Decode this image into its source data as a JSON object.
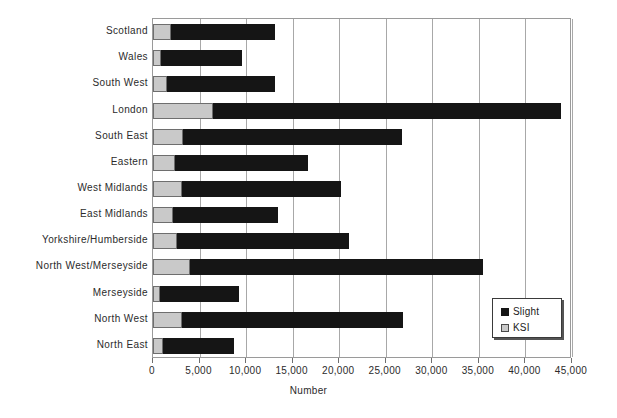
{
  "chart_data": {
    "type": "bar",
    "orientation": "horizontal",
    "stacked": true,
    "title": "",
    "xlabel": "Number",
    "ylabel": "",
    "xlim": [
      0,
      45000
    ],
    "xticks": [
      0,
      5000,
      10000,
      15000,
      20000,
      25000,
      30000,
      35000,
      40000,
      45000
    ],
    "xtick_labels": [
      "0",
      "5,000",
      "10,000",
      "15,000",
      "20,000",
      "25,000",
      "30,000",
      "35,000",
      "40,000",
      "45,000"
    ],
    "grid": "vertical",
    "legend_position": "lower-right",
    "categories": [
      "Scotland",
      "Wales",
      "South West",
      "London",
      "South East",
      "Eastern",
      "West Midlands",
      "East Midlands",
      "Yorkshire/Humberside",
      "North West/Merseyside",
      "Merseyside",
      "North West",
      "North East"
    ],
    "series": [
      {
        "name": "KSI",
        "color": "#c9c9c9",
        "values": [
          1950,
          850,
          1500,
          6450,
          3200,
          2350,
          3100,
          2150,
          2600,
          3950,
          750,
          3100,
          1050
        ]
      },
      {
        "name": "Slight",
        "color": "#151515",
        "values": [
          11150,
          8700,
          11650,
          37350,
          23550,
          14300,
          17100,
          11250,
          18450,
          31500,
          8500,
          23750,
          7650
        ]
      }
    ],
    "totals": [
      13100,
      9550,
      13150,
      43800,
      26750,
      16650,
      20200,
      13400,
      21050,
      35450,
      9250,
      26850,
      8700
    ]
  },
  "legend": {
    "items": [
      {
        "label": "Slight",
        "swatch": "black-square"
      },
      {
        "label": "KSI",
        "swatch": "light-gray-square"
      }
    ]
  }
}
